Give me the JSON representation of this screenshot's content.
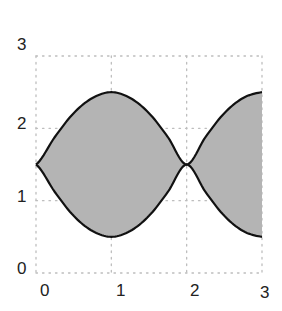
{
  "chart_data": {
    "type": "area",
    "title": "",
    "xlabel": "",
    "ylabel": "",
    "xlim": [
      0,
      3
    ],
    "ylim": [
      0,
      3
    ],
    "grid": true,
    "grid_style": "dotted",
    "x_ticks": [
      "0",
      "1",
      "2",
      "3"
    ],
    "y_ticks": [
      "0",
      "1",
      "2",
      "3"
    ],
    "series": [
      {
        "name": "upper",
        "x": [
          0,
          0.25,
          0.5,
          0.75,
          1,
          1.25,
          1.5,
          1.75,
          2,
          2.25,
          2.5,
          2.75,
          3
        ],
        "values": [
          1.5,
          1.88,
          2.21,
          2.42,
          2.5,
          2.42,
          2.21,
          1.88,
          1.5,
          1.88,
          2.21,
          2.42,
          2.5
        ]
      },
      {
        "name": "lower",
        "x": [
          0,
          0.25,
          0.5,
          0.75,
          1,
          1.25,
          1.5,
          1.75,
          2,
          2.25,
          2.5,
          2.75,
          3
        ],
        "values": [
          1.5,
          1.12,
          0.79,
          0.58,
          0.5,
          0.58,
          0.79,
          1.12,
          1.5,
          1.12,
          0.79,
          0.58,
          0.5
        ]
      }
    ],
    "fill_between": true,
    "colors": {
      "fill": "#b4b4b4",
      "line": "#111111",
      "grid": "#bdbdbd"
    }
  }
}
